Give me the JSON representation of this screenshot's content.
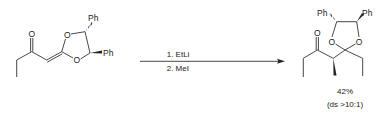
{
  "scheme": {
    "reactant": {
      "name": "starting-material-dioxolane-enone",
      "labels": {
        "carbonyl_O": "O",
        "ring_O_top": "O",
        "ring_O_bottom": "O",
        "ph_top": "Ph",
        "ph_bottom": "Ph"
      }
    },
    "arrow": {
      "conditions": [
        "1.  EtLi",
        "2.  MeI"
      ]
    },
    "product": {
      "name": "product-spiroketal-ketone",
      "labels": {
        "carbonyl_O": "O",
        "ring_O_left": "O",
        "ring_O_right": "O",
        "ph_left": "Ph",
        "ph_right": "Ph"
      },
      "yield": "42%",
      "selectivity": "(ds >10:1)"
    },
    "colors": {
      "ink": "#222222",
      "background": "#ffffff"
    }
  }
}
